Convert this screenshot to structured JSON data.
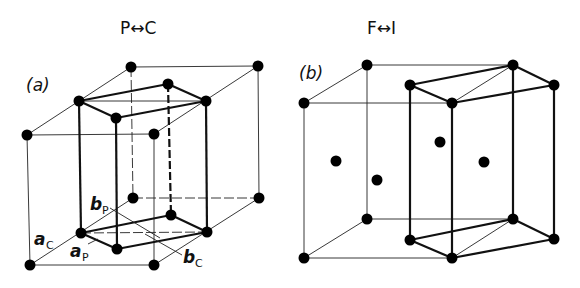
{
  "panel_a": {
    "title": "P↔C",
    "label": "(a)",
    "vectors": [
      {
        "symbol": "a",
        "subscript": "C"
      },
      {
        "symbol": "b",
        "subscript": "P"
      },
      {
        "symbol": "a",
        "subscript": "P"
      },
      {
        "symbol": "b",
        "subscript": "C"
      }
    ]
  },
  "panel_b": {
    "title": "F↔I",
    "label": "(b)"
  }
}
